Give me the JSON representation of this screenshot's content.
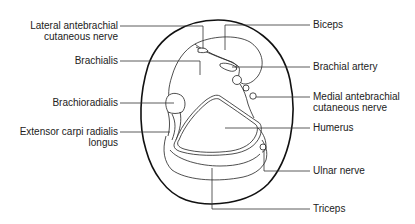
{
  "diagram": {
    "type": "anatomical cross-section",
    "colors": {
      "ink": "#222222",
      "background": "#ffffff"
    },
    "labels_left": [
      {
        "id": "lateral-antebrachial-cutaneous-nerve",
        "lines": [
          "Lateral antebrachial",
          "cutaneous nerve"
        ]
      },
      {
        "id": "brachialis",
        "lines": [
          "Brachialis"
        ]
      },
      {
        "id": "brachioradialis",
        "lines": [
          "Brachioradialis"
        ]
      },
      {
        "id": "extensor-carpi-radialis-longus",
        "lines": [
          "Extensor carpi radialis",
          "longus"
        ]
      }
    ],
    "labels_right": [
      {
        "id": "biceps",
        "lines": [
          "Biceps"
        ]
      },
      {
        "id": "brachial-artery",
        "lines": [
          "Brachial artery"
        ]
      },
      {
        "id": "medial-antebrachial-cutaneous-nerve",
        "lines": [
          "Medial antebrachial",
          "cutaneous nerve"
        ]
      },
      {
        "id": "humerus",
        "lines": [
          "Humerus"
        ]
      },
      {
        "id": "ulnar-nerve",
        "lines": [
          "Ulnar nerve"
        ]
      },
      {
        "id": "triceps",
        "lines": [
          "Triceps"
        ]
      }
    ]
  }
}
